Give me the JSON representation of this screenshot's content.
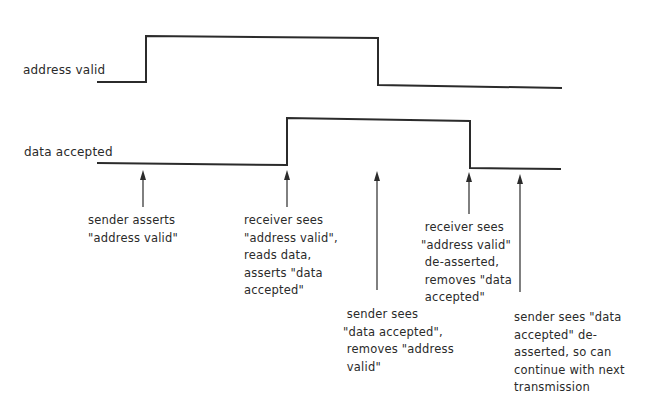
{
  "diagram": {
    "type": "timing-diagram",
    "signals": [
      {
        "id": "address-valid",
        "label": "address valid",
        "label_pos": {
          "x": 23,
          "y": 63
        },
        "path": [
          [
            97,
            82
          ],
          [
            146,
            82
          ],
          [
            146,
            36
          ],
          [
            378,
            38
          ],
          [
            378,
            85
          ],
          [
            562,
            88
          ]
        ]
      },
      {
        "id": "data-accepted",
        "label": "data accepted",
        "label_pos": {
          "x": 24,
          "y": 145
        },
        "path": [
          [
            97,
            163
          ],
          [
            287,
            165
          ],
          [
            287,
            118
          ],
          [
            470,
            121
          ],
          [
            470,
            168
          ],
          [
            561,
            169
          ]
        ]
      }
    ],
    "events": [
      {
        "id": "sender-asserts-address-valid",
        "arrow": {
          "x": 143,
          "tip_y": 170,
          "base_y": 207
        },
        "text_pos": {
          "x": 88,
          "y": 212
        },
        "text": "sender asserts\n\"address valid\""
      },
      {
        "id": "receiver-sees-address-valid",
        "arrow": {
          "x": 287,
          "tip_y": 170,
          "base_y": 207
        },
        "text_pos": {
          "x": 244,
          "y": 212
        },
        "text": "receiver sees\n\"address valid\",\nreads data,\nasserts \"data\naccepted\""
      },
      {
        "id": "sender-sees-data-accepted",
        "arrow": {
          "x": 377,
          "tip_y": 171,
          "base_y": 290
        },
        "text_pos": {
          "x": 343,
          "y": 306
        },
        "text": " sender sees\n\"data accepted\",\n removes \"address\n valid\""
      },
      {
        "id": "receiver-sees-address-valid-deasserted",
        "arrow": {
          "x": 469,
          "tip_y": 172,
          "base_y": 214
        },
        "text_pos": {
          "x": 421,
          "y": 219
        },
        "text": " receiver sees\n\"address valid\"\n de-asserted,\n removes \"data\n accepted\""
      },
      {
        "id": "sender-sees-data-accepted-deasserted",
        "arrow": {
          "x": 520,
          "tip_y": 174,
          "base_y": 292
        },
        "text_pos": {
          "x": 514,
          "y": 309
        },
        "text": "sender sees \"data\naccepted\" de-\nasserted, so can\ncontinue with next\ntransmission"
      }
    ],
    "colors": {
      "line": "#2b2b2b",
      "text": "#2a2a2a",
      "background": "#ffffff"
    }
  }
}
